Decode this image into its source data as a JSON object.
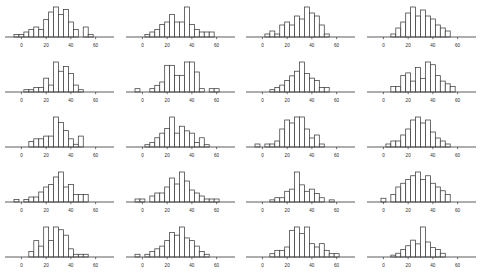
{
  "figure": {
    "title": "",
    "rows": 5,
    "cols": 4,
    "panel_count": 20,
    "background_color": "#ffffff",
    "bar_fill_color": "#ffffff",
    "bar_edge_color": "#3c3c3c",
    "axis_color": "#4a4a4a",
    "tick_label_color": "#2b2b2b"
  },
  "chart_data": {
    "type": "bar",
    "title": "",
    "xlabel": "",
    "ylabel": "",
    "grid": false,
    "legend": "none",
    "shared_axis": {
      "xlim": [
        -6,
        70
      ],
      "ticks": [
        0,
        20,
        40,
        60
      ],
      "tick_labels": [
        "0",
        "20",
        "40",
        "60"
      ],
      "bin_width": 4,
      "bin_edges": [
        -6,
        -2,
        2,
        6,
        10,
        14,
        18,
        22,
        26,
        30,
        34,
        38,
        42,
        46,
        50,
        54,
        58,
        62,
        66,
        70
      ]
    },
    "panels": [
      {
        "index": 1,
        "row": 1,
        "col": 1,
        "bin_counts": [
          1,
          1,
          2,
          3,
          4,
          3,
          7,
          10,
          12,
          9,
          11,
          6,
          3,
          0,
          4,
          1,
          0,
          0,
          0
        ]
      },
      {
        "index": 2,
        "row": 1,
        "col": 2,
        "bin_counts": [
          0,
          0,
          1,
          2,
          3,
          5,
          6,
          9,
          6,
          6,
          12,
          5,
          3,
          2,
          2,
          2,
          0,
          0,
          0
        ]
      },
      {
        "index": 3,
        "row": 1,
        "col": 3,
        "bin_counts": [
          0,
          0,
          1,
          2,
          1,
          4,
          5,
          4,
          7,
          6,
          10,
          8,
          7,
          4,
          1,
          0,
          0,
          0,
          0
        ]
      },
      {
        "index": 4,
        "row": 1,
        "col": 4,
        "bin_counts": [
          0,
          0,
          0,
          1,
          3,
          5,
          8,
          10,
          7,
          9,
          7,
          6,
          4,
          3,
          2,
          0,
          0,
          0,
          0
        ]
      },
      {
        "index": 5,
        "row": 2,
        "col": 1,
        "bin_counts": [
          0,
          0,
          1,
          1,
          2,
          2,
          6,
          3,
          13,
          9,
          11,
          8,
          3,
          1,
          0,
          0,
          0,
          0,
          0
        ]
      },
      {
        "index": 6,
        "row": 2,
        "col": 2,
        "bin_counts": [
          1,
          0,
          0,
          1,
          2,
          3,
          8,
          8,
          5,
          5,
          9,
          9,
          6,
          1,
          0,
          1,
          1,
          0,
          0
        ]
      },
      {
        "index": 7,
        "row": 2,
        "col": 3,
        "bin_counts": [
          0,
          0,
          0,
          1,
          2,
          3,
          5,
          7,
          9,
          13,
          8,
          6,
          5,
          2,
          2,
          0,
          0,
          0,
          0
        ]
      },
      {
        "index": 8,
        "row": 2,
        "col": 4,
        "bin_counts": [
          0,
          0,
          0,
          2,
          2,
          6,
          7,
          4,
          9,
          5,
          11,
          10,
          6,
          4,
          3,
          2,
          0,
          0,
          0
        ]
      },
      {
        "index": 9,
        "row": 3,
        "col": 1,
        "bin_counts": [
          0,
          0,
          0,
          2,
          3,
          3,
          4,
          4,
          11,
          9,
          6,
          3,
          1,
          4,
          0,
          0,
          0,
          0,
          0
        ]
      },
      {
        "index": 10,
        "row": 3,
        "col": 2,
        "bin_counts": [
          0,
          0,
          1,
          2,
          4,
          6,
          8,
          13,
          6,
          9,
          7,
          6,
          2,
          4,
          1,
          0,
          0,
          0,
          0
        ]
      },
      {
        "index": 11,
        "row": 3,
        "col": 3,
        "bin_counts": [
          1,
          0,
          1,
          1,
          2,
          6,
          9,
          8,
          10,
          10,
          6,
          3,
          4,
          1,
          0,
          0,
          0,
          0,
          0
        ]
      },
      {
        "index": 12,
        "row": 3,
        "col": 4,
        "bin_counts": [
          0,
          0,
          1,
          2,
          2,
          4,
          6,
          9,
          10,
          8,
          9,
          5,
          3,
          2,
          1,
          0,
          0,
          0,
          0
        ]
      },
      {
        "index": 13,
        "row": 4,
        "col": 1,
        "bin_counts": [
          1,
          0,
          1,
          2,
          2,
          4,
          6,
          7,
          10,
          12,
          6,
          7,
          3,
          3,
          3,
          0,
          0,
          0,
          0
        ]
      },
      {
        "index": 14,
        "row": 4,
        "col": 2,
        "bin_counts": [
          1,
          1,
          0,
          2,
          3,
          3,
          5,
          8,
          6,
          10,
          7,
          4,
          3,
          2,
          1,
          1,
          1,
          0,
          0
        ]
      },
      {
        "index": 15,
        "row": 4,
        "col": 3,
        "bin_counts": [
          0,
          0,
          0,
          1,
          2,
          2,
          5,
          6,
          14,
          8,
          5,
          6,
          4,
          2,
          0,
          1,
          0,
          0,
          0
        ]
      },
      {
        "index": 16,
        "row": 4,
        "col": 4,
        "bin_counts": [
          0,
          1,
          0,
          2,
          4,
          5,
          6,
          7,
          8,
          6,
          7,
          5,
          4,
          3,
          2,
          0,
          0,
          0,
          0
        ]
      },
      {
        "index": 17,
        "row": 5,
        "col": 1,
        "bin_counts": [
          0,
          0,
          0,
          2,
          6,
          4,
          11,
          6,
          11,
          10,
          8,
          3,
          1,
          1,
          1,
          0,
          0,
          0,
          0
        ]
      },
      {
        "index": 18,
        "row": 5,
        "col": 2,
        "bin_counts": [
          1,
          0,
          1,
          2,
          3,
          4,
          6,
          9,
          8,
          11,
          7,
          6,
          4,
          2,
          1,
          0,
          0,
          0,
          0
        ]
      },
      {
        "index": 19,
        "row": 5,
        "col": 3,
        "bin_counts": [
          0,
          0,
          0,
          1,
          2,
          2,
          3,
          8,
          9,
          7,
          9,
          4,
          3,
          4,
          2,
          1,
          1,
          0,
          0
        ]
      },
      {
        "index": 20,
        "row": 5,
        "col": 4,
        "bin_counts": [
          0,
          0,
          0,
          1,
          2,
          4,
          6,
          9,
          7,
          16,
          8,
          5,
          4,
          2,
          0,
          0,
          0,
          0,
          0
        ]
      }
    ]
  }
}
